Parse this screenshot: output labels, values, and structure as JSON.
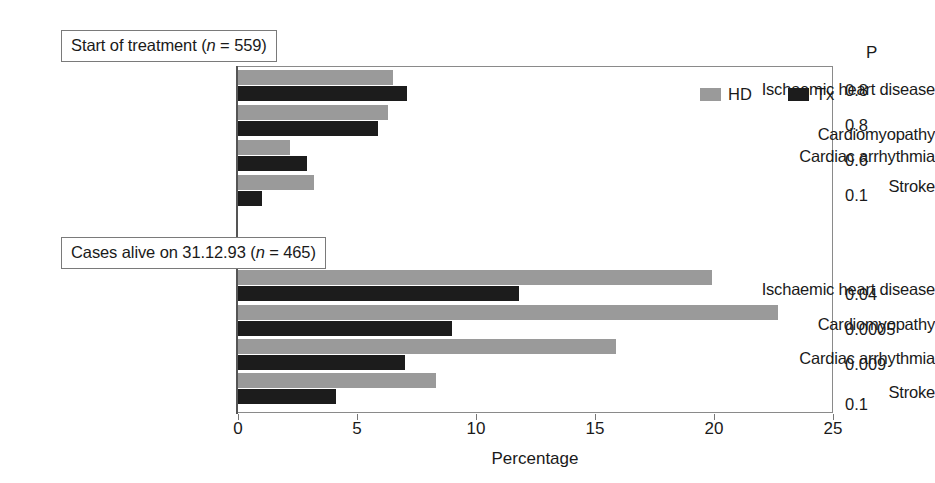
{
  "chart_data": {
    "type": "bar",
    "title": "",
    "orientation": "horizontal",
    "xlabel": "Percentage",
    "ylabel": "",
    "xlim": [
      0,
      25
    ],
    "xticks": [
      0,
      5,
      10,
      15,
      20,
      25
    ],
    "xtick_labels": [
      "0",
      "5",
      "10",
      "15",
      "20",
      "25"
    ],
    "grid": false,
    "legend": {
      "position": "top-right-inside",
      "entries": [
        {
          "name": "HD",
          "color": "#9a9a9a"
        },
        {
          "name": "Tx",
          "color": "#1c1c1c"
        }
      ]
    },
    "groups": [
      {
        "id": "start-of-treatment",
        "label_prefix": "Start of treatment (",
        "label_n_symbol": "n",
        "label_suffix": " = 559)",
        "label_full": "Start of treatment (n = 559)",
        "categories": [
          "Ischaemic heart disease",
          "Cardiomyopathy",
          "Cardiac arrhythmia",
          "Stroke"
        ],
        "series": [
          {
            "name": "HD",
            "values": [
              6.5,
              6.3,
              2.2,
              3.2
            ]
          },
          {
            "name": "Tx",
            "values": [
              7.1,
              5.9,
              2.9,
              1.0
            ]
          }
        ],
        "p_values": [
          "0.8",
          "0.8",
          "0.6",
          "0.1"
        ]
      },
      {
        "id": "cases-alive",
        "label_prefix": "Cases alive on 31.12.93 (",
        "label_n_symbol": "n",
        "label_suffix": " = 465)",
        "label_full": "Cases alive on 31.12.93 (n = 465)",
        "categories": [
          "Ischaemic heart disease",
          "Cardiomyopathy",
          "Cardiac arrhythmia",
          "Stroke"
        ],
        "series": [
          {
            "name": "HD",
            "values": [
              19.9,
              22.7,
              15.9,
              8.3
            ]
          },
          {
            "name": "Tx",
            "values": [
              11.8,
              9.0,
              7.0,
              4.1
            ]
          }
        ],
        "p_values": [
          "0.04",
          "0.0005",
          "0.009",
          "0.1"
        ]
      }
    ],
    "p_column_header": "P",
    "colors": {
      "hd": "#9a9a9a",
      "tx": "#1c1c1c",
      "axis": "#555555",
      "frame": "#8a8a8a",
      "background": "#ffffff"
    }
  }
}
